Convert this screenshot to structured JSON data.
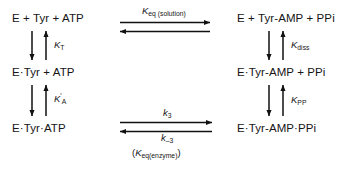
{
  "diagram": {
    "type": "reaction-scheme",
    "colors": {
      "background": "#ffffff",
      "text": "#151515",
      "arrow": "#111111"
    },
    "species": {
      "left_top": "E + Tyr + ATP",
      "left_middle": "E·Tyr + ATP",
      "left_bottom": "E·Tyr·ATP",
      "right_top": "E + Tyr-AMP + PPi",
      "right_middle": "E·Tyr-AMP + PPi",
      "right_bottom": "E·Tyr-AMP·PPi"
    },
    "constants": {
      "left_upper": {
        "symbol": "K",
        "sub": "T",
        "prime": ""
      },
      "left_lower": {
        "symbol": "K",
        "sub": "A",
        "prime": "′"
      },
      "right_upper": {
        "symbol": "K",
        "sub": "diss",
        "prime": ""
      },
      "right_lower": {
        "symbol": "K",
        "sub": "PP",
        "prime": ""
      },
      "top_horizontal": {
        "symbol": "K",
        "sub": "eq (solution)",
        "prime": ""
      },
      "bottom_forward": {
        "symbol": "k",
        "sub": "3",
        "prime": ""
      },
      "bottom_reverse": {
        "symbol": "k",
        "sub": "–3",
        "prime": ""
      },
      "bottom_overall": {
        "open": "(",
        "symbol": "K",
        "sub": "eq(enzyme)",
        "close": ")"
      }
    },
    "arrows": {
      "top_horizontal_forward": "arrow-right-icon",
      "top_horizontal_reverse": "arrow-left-icon",
      "bottom_horizontal_forward": "arrow-right-icon",
      "bottom_horizontal_reverse": "arrow-left-icon",
      "left_upper_down": "arrow-down-icon",
      "left_upper_up": "arrow-up-icon",
      "left_lower_down": "arrow-down-icon",
      "left_lower_up": "arrow-up-icon",
      "right_upper_down": "arrow-down-icon",
      "right_upper_up": "arrow-up-icon",
      "right_lower_down": "arrow-down-icon",
      "right_lower_up": "arrow-up-icon"
    }
  }
}
